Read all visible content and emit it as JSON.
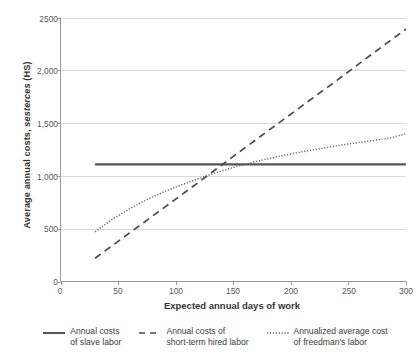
{
  "chart_data": {
    "type": "line",
    "title": "",
    "xlabel": "Expected annual days of work",
    "ylabel": "Average annual costs, sesterces (HS)",
    "ylabel_plain": "Average annual costs, ",
    "ylabel_italic": "sesterces",
    "ylabel_tail": " (HS)",
    "xlim": [
      0,
      300
    ],
    "ylim": [
      0,
      2500
    ],
    "xticks": [
      "0",
      "50",
      "100",
      "150",
      "200",
      "250",
      "300"
    ],
    "xtick_values": [
      0,
      50,
      100,
      150,
      200,
      250,
      300
    ],
    "yticks": [
      "0",
      "500",
      "1,000",
      "1,500",
      "2,000",
      "2500"
    ],
    "ytick_values": [
      0,
      500,
      1000,
      1500,
      2000,
      2500
    ],
    "grid": "horizontal",
    "legend_position": "bottom",
    "series": [
      {
        "name": "Annual costs of slave labor",
        "legend_label_line1": "Annual costs",
        "legend_label_line2": "of slave labor",
        "style": "solid",
        "color": "#555555",
        "x": [
          30,
          60,
          90,
          120,
          150,
          180,
          210,
          240,
          270,
          300
        ],
        "values": [
          1110,
          1110,
          1110,
          1110,
          1110,
          1110,
          1110,
          1110,
          1110,
          1110
        ]
      },
      {
        "name": "Annual costs of short-term hired labor",
        "legend_label_line1": "Annual costs of",
        "legend_label_line2": "short-term hired labor",
        "style": "dashed",
        "color": "#4a4a4a",
        "x": [
          30,
          60,
          90,
          120,
          150,
          180,
          210,
          240,
          270,
          300
        ],
        "values": [
          220,
          460,
          700,
          940,
          1185,
          1425,
          1665,
          1905,
          2150,
          2390
        ]
      },
      {
        "name": "Annualized average cost of freedman's labor",
        "legend_label_line1": "Annualized average cost",
        "legend_label_line2": "of freedman's labor",
        "style": "dotted",
        "color": "#6a6a6a",
        "x": [
          30,
          45,
          60,
          75,
          90,
          105,
          120,
          135,
          150,
          165,
          180,
          195,
          210,
          225,
          240,
          255,
          270,
          285,
          300
        ],
        "values": [
          470,
          590,
          690,
          775,
          850,
          915,
          975,
          1030,
          1080,
          1123,
          1162,
          1197,
          1229,
          1258,
          1285,
          1310,
          1333,
          1355,
          1400
        ]
      }
    ],
    "colors": {
      "grid": "#d9d9d9",
      "axis": "#9a9a9a",
      "text": "#3b3b3b",
      "background": "#ffffff"
    }
  }
}
